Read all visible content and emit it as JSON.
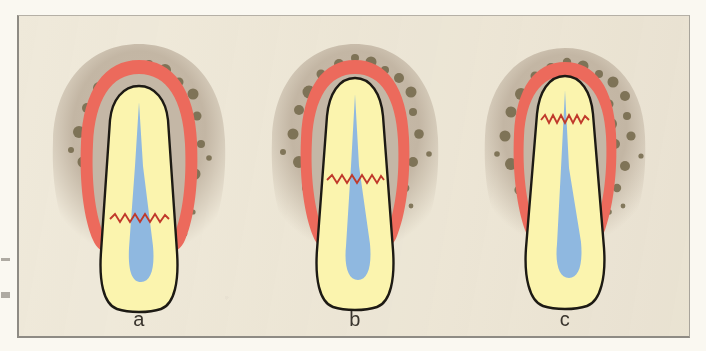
{
  "figure": {
    "kind": "dental-illustration",
    "background_color": "#efe9da",
    "frame_color": "#8e8b84",
    "panel_count": 3
  },
  "palette": {
    "paper": "#efe9da",
    "bone": "#c4b7a6",
    "bone_speck": "#6f6446",
    "gingiva": "#ec6a5c",
    "gingiva_dark": "#d8534a",
    "tooth": "#fbf4ae",
    "tooth_outline": "#1d1a14",
    "pulp": "#8fb8e0",
    "attachment_line": "#c0392b",
    "label_text": "#3a352e"
  },
  "panels": [
    {
      "id": "a",
      "label": "a",
      "attachment_level_pct": 60,
      "bone_crest_pct": 62,
      "gingival_margin_pct": 52,
      "description": "Epithelial attachment at the cemento-enamel junction; bone crest at normal height"
    },
    {
      "id": "b",
      "label": "b",
      "attachment_level_pct": 44,
      "bone_crest_pct": 50,
      "gingival_margin_pct": 44,
      "description": "Attachment migrated apically; moderate crestal bone loss"
    },
    {
      "id": "c",
      "label": "c",
      "attachment_level_pct": 27,
      "bone_crest_pct": 40,
      "gingival_margin_pct": 34,
      "description": "Attachment near the root apex; advanced bone loss"
    }
  ],
  "structures": [
    {
      "name": "alveolar-bone",
      "color": "#c4b7a6"
    },
    {
      "name": "gingiva",
      "color": "#ec6a5c"
    },
    {
      "name": "tooth",
      "color": "#fbf4ae"
    },
    {
      "name": "pulp",
      "color": "#8fb8e0"
    },
    {
      "name": "epithelial-attachment-line",
      "color": "#c0392b"
    }
  ]
}
